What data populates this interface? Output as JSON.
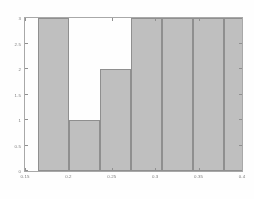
{
  "figure": {
    "background_color": "#ffffff",
    "axes_border_color": "#a8a8a8",
    "tick_color": "#8f8f8f",
    "tick_label_color": "#7a7a7a"
  },
  "chart_data": {
    "type": "bar",
    "title": "",
    "subtitle": "",
    "xlabel": "",
    "ylabel": "",
    "grid": false,
    "legend": null,
    "xlim": [
      0.15,
      0.4
    ],
    "ylim": [
      0,
      3
    ],
    "xticks": [
      0.15,
      0.2,
      0.25,
      0.3,
      0.35,
      0.4
    ],
    "xtick_labels": [
      "0.15",
      "0.2",
      "0.25",
      "0.3",
      "0.35",
      "0.4"
    ],
    "yticks": [
      0,
      0.5,
      1,
      1.5,
      2,
      2.5,
      3
    ],
    "ytick_labels": [
      "0",
      "0.5",
      "1",
      "1.5",
      "2",
      "2.5",
      "3"
    ],
    "bar_fill_color": "#bfbfbf",
    "bar_edge_color": "#8e8e8e",
    "bin_edges": [
      0.165,
      0.2007,
      0.2364,
      0.2721,
      0.3079,
      0.3436,
      0.3793,
      0.415
    ],
    "categories": [
      "0.165-0.201",
      "0.201-0.236",
      "0.236-0.272",
      "0.272-0.308",
      "0.308-0.344",
      "0.344-0.379",
      "0.379-0.415"
    ],
    "values": [
      3,
      1,
      2,
      3,
      3,
      3,
      3
    ],
    "annotations": []
  }
}
